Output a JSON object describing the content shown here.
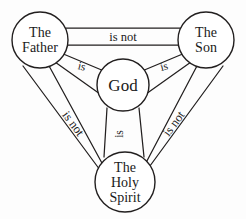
{
  "diagram": {
    "background_color": "#fdfdfd",
    "stroke_color": "#221f1f",
    "text_color": "#1a1a1a",
    "nodes": [
      {
        "id": "father",
        "lines": [
          "The",
          "Father"
        ],
        "line1": "The",
        "line2": "Father",
        "cx": 40,
        "cy": 40,
        "r": 28
      },
      {
        "id": "son",
        "lines": [
          "The",
          "Son"
        ],
        "line1": "The",
        "line2": "Son",
        "cx": 206,
        "cy": 40,
        "r": 28
      },
      {
        "id": "god",
        "lines": [
          "God"
        ],
        "line1": "God",
        "cx": 123,
        "cy": 85,
        "r": 26
      },
      {
        "id": "holy-spirit",
        "lines": [
          "The",
          "Holy",
          "Spirit"
        ],
        "line1": "The",
        "line2": "Holy",
        "line3": "Spirit",
        "cx": 125,
        "cy": 182,
        "r": 30
      }
    ],
    "edges": [
      {
        "id": "father-son",
        "label": "is not",
        "from": "father",
        "to": "son",
        "orientation": "horizontal"
      },
      {
        "id": "father-holyspirit",
        "label": "is not",
        "from": "father",
        "to": "holy-spirit",
        "orientation": "diagonal-left"
      },
      {
        "id": "son-holyspirit",
        "label": "is not",
        "from": "son",
        "to": "holy-spirit",
        "orientation": "diagonal-right"
      },
      {
        "id": "father-god",
        "label": "is",
        "from": "father",
        "to": "god",
        "orientation": "inner-left"
      },
      {
        "id": "son-god",
        "label": "is",
        "from": "son",
        "to": "god",
        "orientation": "inner-right"
      },
      {
        "id": "god-holyspirit",
        "label": "is",
        "from": "god",
        "to": "holy-spirit",
        "orientation": "inner-vertical"
      }
    ]
  }
}
